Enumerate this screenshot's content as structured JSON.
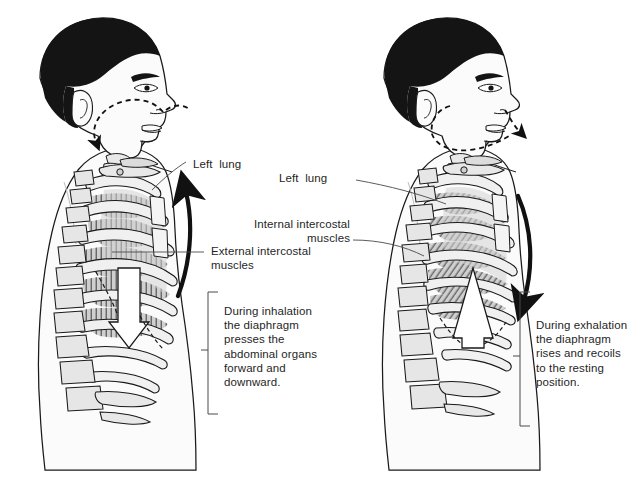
{
  "diagram": {
    "background_color": "#ffffff",
    "ink_color": "#1a1a1a",
    "hair_color": "#111111",
    "skin_fill": "#fbfbfb",
    "bone_fill": "#eeeeee",
    "muscle_fill": "#c9c9c9",
    "lung_fill": "#d8d8d8"
  },
  "left_panel": {
    "name": "inhalation-figure",
    "airflow_direction": "in",
    "airflow_arrow": "dashed arrow from nostril curving down into pharynx",
    "rib_motion_arrow": "black curved arrow sweeping upward",
    "diaphragm_arrow": "white block arrow pointing down",
    "labels": {
      "lung": "Left  lung",
      "muscles": "External intercostal\nmuscles"
    },
    "caption": "During inhalation\nthe diaphragm\npresses the\nabdominal organs\nforward and\ndownward."
  },
  "right_panel": {
    "name": "exhalation-figure",
    "airflow_direction": "out",
    "airflow_arrow": "dashed arrow from nostril curving out past the mouth",
    "rib_motion_arrow": "black curved arrow sweeping downward",
    "diaphragm_arrow": "white block arrow pointing up",
    "labels": {
      "lung": "Left  lung",
      "muscles": "Internal intercostal\nmuscles"
    },
    "caption": "During exhalation\nthe diaphragm\nrises and recoils\nto the resting\nposition."
  }
}
